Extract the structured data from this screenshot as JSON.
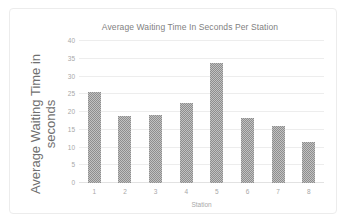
{
  "chart_data": {
    "type": "bar",
    "title": "Average Waiting Time In Seconds Per Station",
    "xlabel": "Station",
    "ylabel_lines": [
      "Average Waiting Time in",
      "seconds"
    ],
    "ylabel": "Average Waiting Time in seconds",
    "categories": [
      "1",
      "2",
      "3",
      "4",
      "5",
      "6",
      "7",
      "8"
    ],
    "values": [
      25.5,
      19,
      19.2,
      22.5,
      33.8,
      18.4,
      16,
      11.5
    ],
    "series": [
      {
        "name": "Average Waiting Time",
        "values": [
          25.5,
          19,
          19.2,
          22.5,
          33.8,
          18.4,
          16,
          11.5
        ]
      }
    ],
    "yticks": [
      0,
      5,
      10,
      15,
      20,
      25,
      30,
      35,
      40
    ],
    "ytick_labels": [
      "0",
      "5",
      "10",
      "15",
      "20",
      "25",
      "30",
      "35",
      "40"
    ],
    "ylim": [
      0,
      40
    ],
    "grid": true,
    "grid_axis": "y",
    "legend": false,
    "legend_position": "none",
    "bar_color": "#8e8e8e",
    "grid_color": "#ededed",
    "text_color": "#a8a8a8",
    "title_color": "#7f7f7f",
    "background": "#ffffff"
  }
}
